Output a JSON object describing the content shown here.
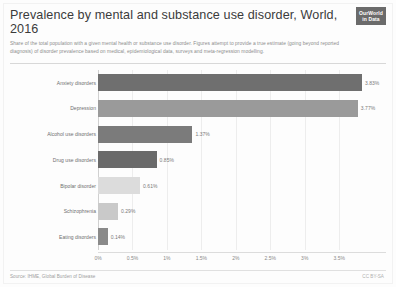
{
  "header": {
    "title": "Prevalence by mental and substance use disorder, World, 2016",
    "subtitle": "Share of the total population with a given mental health or substance use disorder. Figures attempt to provide a true estimate (going beyond reported diagnosis) of disorder prevalence based on medical, epidemiological data, surveys and meta-regression modelling.",
    "logo_line1": "OurWorld",
    "logo_line2": "in Data"
  },
  "footer": {
    "source": "Source: IHME, Global Burden of Disease",
    "license": "CC BY-SA"
  },
  "colors": {
    "bar_dark": "#6f6f6f",
    "bar_mid": "#8e8e8e",
    "bar_light": "#c9c9c9",
    "grid": "#ededed",
    "text": "#6e6e6e",
    "logo_bg": "#6b6b6b"
  },
  "chart_data": {
    "type": "bar",
    "orientation": "horizontal",
    "title": "Prevalence by mental and substance use disorder, World, 2016",
    "subtitle": "Share of the total population with a given mental health or substance use disorder. Figures attempt to provide a true estimate (going beyond reported diagnosis) of disorder prevalence based on medical, epidemiological data, surveys and meta-regression modelling.",
    "xlabel": "",
    "ylabel": "",
    "xlim": [
      0,
      4.15
    ],
    "grid": true,
    "legend": false,
    "categories": [
      "Anxiety disorders",
      "Depression",
      "Alcohol use disorders",
      "Drug use disorders",
      "Bipolar disorder",
      "Schizophrenia",
      "Eating disorders"
    ],
    "values": [
      3.83,
      3.77,
      1.37,
      0.85,
      0.61,
      0.29,
      0.14
    ],
    "value_labels": [
      "3.83%",
      "3.77%",
      "1.37%",
      "0.85%",
      "0.61%",
      "0.29%",
      "0.14%"
    ],
    "bar_colors": [
      "#6f6f6f",
      "#9a9a9a",
      "#7b7b7b",
      "#6a6a6a",
      "#dcdcdc",
      "#c9c9c9",
      "#8a8a8a"
    ],
    "xticks": [
      0,
      0.5,
      1,
      1.5,
      2,
      2.5,
      3,
      3.5
    ],
    "xtick_labels": [
      "0%",
      "0.5%",
      "1%",
      "1.5%",
      "2%",
      "2.5%",
      "3%",
      "3.5%"
    ]
  }
}
